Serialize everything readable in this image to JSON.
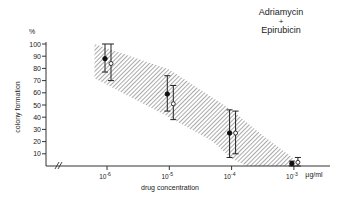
{
  "chart_data": {
    "type": "scatter",
    "title": "Adriamycin + Epirubicin",
    "title_lines": [
      "Adriamycin",
      "+",
      "Epirubicin"
    ],
    "xlabel": "drug concentration",
    "ylabel": "colony formation",
    "y_unit": "%",
    "x_unit": "µg/ml",
    "x_scale": "log",
    "ylim": [
      0,
      100
    ],
    "yticks": [
      10,
      20,
      30,
      40,
      50,
      60,
      70,
      80,
      90,
      100
    ],
    "xticks": [
      {
        "exp": -6,
        "label": "10",
        "sup": "-6"
      },
      {
        "exp": -5,
        "label": "10",
        "sup": "-5"
      },
      {
        "exp": -4,
        "label": "10",
        "sup": "-4"
      },
      {
        "exp": -3,
        "label": "10",
        "sup": "-3"
      }
    ],
    "grid": false,
    "axis_break": true,
    "series": [
      {
        "name": "Adriamycin",
        "marker": "filled-circle",
        "points": [
          {
            "x_exp": -6,
            "y": 88,
            "ylo": 77,
            "yhi": 100
          },
          {
            "x_exp": -5,
            "y": 59,
            "ylo": 45,
            "yhi": 74
          },
          {
            "x_exp": -4,
            "y": 27,
            "ylo": 7,
            "yhi": 46
          },
          {
            "x_exp": -3,
            "y": 2,
            "ylo": 0,
            "yhi": 4
          }
        ]
      },
      {
        "name": "Epirubicin",
        "marker": "open-circle",
        "points": [
          {
            "x_exp": -6,
            "y": 84,
            "ylo": 70,
            "yhi": 100
          },
          {
            "x_exp": -5,
            "y": 51,
            "ylo": 38,
            "yhi": 66
          },
          {
            "x_exp": -4,
            "y": 27,
            "ylo": 10,
            "yhi": 45
          },
          {
            "x_exp": -3,
            "y": 3,
            "ylo": 0,
            "yhi": 7
          }
        ]
      }
    ],
    "band": {
      "description": "hatched confidence band",
      "upper": [
        [
          -6.2,
          100
        ],
        [
          -5,
          79
        ],
        [
          -4,
          46
        ],
        [
          -3.5,
          25
        ],
        [
          -3,
          6
        ]
      ],
      "lower": [
        [
          -6.2,
          72
        ],
        [
          -5,
          40
        ],
        [
          -4.3,
          20
        ],
        [
          -4,
          6
        ],
        [
          -3.75,
          0
        ],
        [
          -3,
          0
        ]
      ]
    }
  }
}
